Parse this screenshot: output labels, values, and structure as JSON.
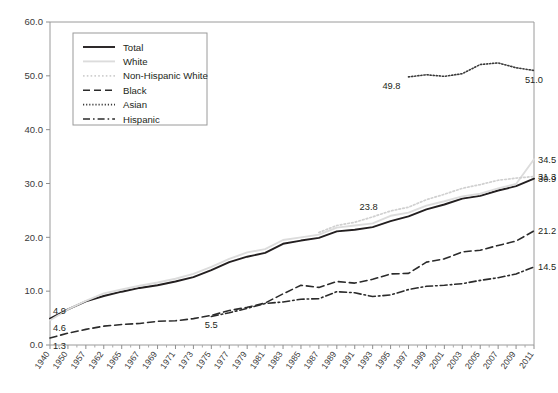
{
  "chart_data": {
    "type": "line",
    "title": "",
    "subtitle": "",
    "xlabel": "",
    "ylabel": "",
    "ylim": [
      0.0,
      60.0
    ],
    "yticks": [
      "0.0",
      "10.0",
      "20.0",
      "30.0",
      "40.0",
      "50.0",
      "60.0"
    ],
    "ytick_values": [
      0,
      10,
      20,
      30,
      40,
      50,
      60
    ],
    "grid": false,
    "legend_position": "top-left",
    "x": [
      1940,
      1950,
      1957,
      1962,
      1965,
      1967,
      1969,
      1971,
      1973,
      1975,
      1977,
      1979,
      1981,
      1983,
      1985,
      1987,
      1989,
      1991,
      1993,
      1995,
      1997,
      1999,
      2001,
      2003,
      2005,
      2007,
      2009,
      2011
    ],
    "xtick_labels": [
      "1940",
      "1950",
      "1957",
      "1962",
      "1965",
      "1967",
      "1969",
      "1971",
      "1973",
      "1975",
      "1977",
      "1979",
      "1981",
      "1983",
      "1985",
      "1987",
      "1989",
      "1991",
      "1993",
      "1995",
      "1997",
      "1999",
      "2001",
      "2003",
      "2005",
      "2007",
      "2009",
      "2011"
    ],
    "series": [
      {
        "name": "Total",
        "style": "solid",
        "color": "#231f20",
        "width": 1.9,
        "values": [
          4.9,
          6.6,
          8.1,
          9.1,
          9.9,
          10.6,
          11.1,
          11.8,
          12.6,
          13.9,
          15.4,
          16.4,
          17.1,
          18.8,
          19.4,
          19.9,
          21.1,
          21.4,
          21.9,
          23.0,
          23.9,
          25.2,
          26.1,
          27.2,
          27.7,
          28.7,
          29.5,
          30.9
        ],
        "endpoint_label": "30.9",
        "start_label": "4.9"
      },
      {
        "name": "White",
        "style": "solid",
        "color": "#dcdcdc",
        "width": 1.9,
        "values": [
          4.6,
          6.6,
          8.2,
          9.6,
          10.3,
          11.0,
          11.6,
          12.3,
          13.2,
          14.5,
          16.0,
          17.2,
          17.8,
          19.5,
          20.0,
          20.5,
          21.8,
          22.2,
          22.6,
          24.0,
          24.6,
          25.9,
          26.7,
          27.6,
          28.1,
          29.1,
          29.9,
          34.5
        ],
        "endpoint_label": "34.5",
        "start_label": "4.6"
      },
      {
        "name": "Non-Hispanic White",
        "style": "dotted",
        "color": "#d0d0d0",
        "width": 1.7,
        "values": [
          null,
          null,
          null,
          null,
          null,
          null,
          null,
          null,
          null,
          null,
          null,
          null,
          null,
          null,
          null,
          20.9,
          22.2,
          22.8,
          23.8,
          24.9,
          25.6,
          27.0,
          28.0,
          29.1,
          29.8,
          30.6,
          31.0,
          31.3
        ],
        "endpoint_label": "31.3",
        "annotation_label": "23.8"
      },
      {
        "name": "Black",
        "style": "dashed",
        "color": "#2b2b2b",
        "width": 1.6,
        "values": [
          1.3,
          2.2,
          2.9,
          3.5,
          3.8,
          4.0,
          4.4,
          4.5,
          4.9,
          5.5,
          6.4,
          7.0,
          7.8,
          9.5,
          11.1,
          10.7,
          11.8,
          11.5,
          12.2,
          13.2,
          13.3,
          15.4,
          16.0,
          17.3,
          17.6,
          18.5,
          19.3,
          21.2
        ],
        "endpoint_label": "21.2",
        "start_label": "1.3",
        "annotation_label": "5.5"
      },
      {
        "name": "Asian",
        "style": "finedotted",
        "color": "#3a3a3a",
        "width": 1.6,
        "values": [
          null,
          null,
          null,
          null,
          null,
          null,
          null,
          null,
          null,
          null,
          null,
          null,
          null,
          null,
          null,
          null,
          null,
          null,
          null,
          null,
          49.8,
          50.2,
          49.9,
          50.4,
          52.1,
          52.4,
          51.5,
          51.0
        ],
        "endpoint_label": "51.0",
        "start_label": "49.8"
      },
      {
        "name": "Hispanic",
        "style": "dashdot",
        "color": "#2b2b2b",
        "width": 1.6,
        "values": [
          null,
          null,
          null,
          null,
          null,
          null,
          null,
          null,
          null,
          5.3,
          6.0,
          6.8,
          7.7,
          8.0,
          8.5,
          8.6,
          9.9,
          9.7,
          9.0,
          9.3,
          10.3,
          10.9,
          11.1,
          11.4,
          12.0,
          12.5,
          13.2,
          14.5
        ],
        "endpoint_label": "14.5"
      }
    ],
    "annotations": [
      {
        "text": "4.9",
        "x": 1940,
        "y": 4.9,
        "anchor": "start-above"
      },
      {
        "text": "4.6",
        "x": 1940,
        "y": 4.6,
        "anchor": "start-below"
      },
      {
        "text": "1.3",
        "x": 1940,
        "y": 1.3,
        "anchor": "start-below"
      },
      {
        "text": "5.5",
        "x": 1975,
        "y": 5.5,
        "anchor": "below"
      },
      {
        "text": "23.8",
        "x": 1993,
        "y": 23.8,
        "anchor": "above"
      },
      {
        "text": "49.8",
        "x": 1997,
        "y": 49.8,
        "anchor": "below-left"
      },
      {
        "text": "51.0",
        "x": 2011,
        "y": 51.0,
        "anchor": "below"
      },
      {
        "text": "34.5",
        "x": 2011,
        "y": 34.5,
        "anchor": "end"
      },
      {
        "text": "31.3",
        "x": 2011,
        "y": 31.3,
        "anchor": "end"
      },
      {
        "text": "30.9",
        "x": 2011,
        "y": 30.9,
        "anchor": "end"
      },
      {
        "text": "21.2",
        "x": 2011,
        "y": 21.2,
        "anchor": "end"
      },
      {
        "text": "14.5",
        "x": 2011,
        "y": 14.5,
        "anchor": "end"
      }
    ]
  },
  "legend": {
    "items": [
      {
        "label": "Total"
      },
      {
        "label": "White"
      },
      {
        "label": "Non-Hispanic White"
      },
      {
        "label": "Black"
      },
      {
        "label": "Asian"
      },
      {
        "label": "Hispanic"
      }
    ]
  }
}
